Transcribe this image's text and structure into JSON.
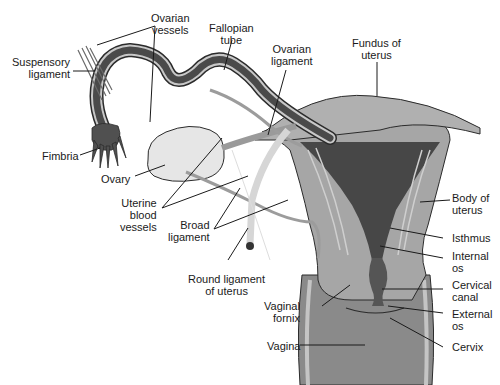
{
  "diagram": {
    "colors": {
      "background": "#ffffff",
      "lumen_dark": "#4a4a4a",
      "tissue_mid": "#8e8e8e",
      "tissue_light": "#b8b8b8",
      "ovary": "#e4e4e4",
      "outline": "#2b2b2b",
      "label_text": "#1a1a1a"
    },
    "labels": {
      "ovarian_vessels": "Ovarian\nvessels",
      "fallopian_tube": "Fallopian\ntube",
      "suspensory_ligament": "Suspensory\nligament",
      "ovarian_ligament": "Ovarian\nligament",
      "fundus_of_uterus": "Fundus of\nuterus",
      "fimbria": "Fimbria",
      "ovary": "Ovary",
      "uterine_blood_vessels": "Uterine\nblood\nvessels",
      "broad_ligament": "Broad\nligament",
      "round_ligament": "Round ligament\nof uterus",
      "body_of_uterus": "Body of\nuterus",
      "isthmus": "Isthmus",
      "internal_os": "Internal\nos",
      "cervical_canal": "Cervical\ncanal",
      "vaginal_fornix": "Vaginal\nfornix",
      "external_os": "External\nos",
      "vagina": "Vagina",
      "cervix": "Cervix"
    }
  }
}
